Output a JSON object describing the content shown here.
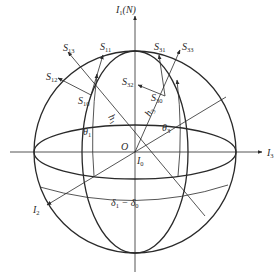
{
  "diagram": {
    "type": "spherical-coordinate-sketch",
    "center": {
      "label": "O",
      "x": 135,
      "y": 152
    },
    "sphere_radius": 100,
    "axes": {
      "I1": {
        "main": "I",
        "sub": "1",
        "suffix": "(N)"
      },
      "I2": {
        "main": "I",
        "sub": "2"
      },
      "I3": {
        "main": "I",
        "sub": "3"
      },
      "I0": {
        "main": "I",
        "sub": "0"
      }
    },
    "vectors": {
      "S13": {
        "main": "S",
        "sub": "13"
      },
      "S11": {
        "main": "S",
        "sub": "11"
      },
      "S12": {
        "main": "S",
        "sub": "12"
      },
      "S10": {
        "main": "S",
        "sub": "10"
      },
      "S31": {
        "main": "S",
        "sub": "31"
      },
      "S33": {
        "main": "S",
        "sub": "33"
      },
      "S32": {
        "main": "S",
        "sub": "32"
      },
      "S30": {
        "main": "S",
        "sub": "30"
      }
    },
    "parameters": {
      "h1": {
        "main": "h",
        "sub": "1"
      },
      "h3": {
        "main": "h",
        "sub": "3"
      },
      "theta1": {
        "main": "θ",
        "sub": "1"
      },
      "theta3": {
        "main": "θ",
        "sub": "3"
      },
      "delta": {
        "a_main": "δ",
        "a_sub": "1",
        "op": " − ",
        "b_main": "δ",
        "b_sub": "0"
      }
    },
    "origin_label": "O",
    "colors": {
      "stroke": "#2a2a2a",
      "background": "#ffffff"
    }
  }
}
